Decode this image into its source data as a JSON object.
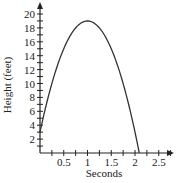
{
  "chart_data": {
    "type": "line",
    "title": "",
    "xlabel": "Seconds",
    "ylabel": "Height (feet)",
    "xlim": [
      0,
      2.75
    ],
    "ylim": [
      0,
      21
    ],
    "x_tick_labels": [
      "0.5",
      "1",
      "1.5",
      "2",
      "2.5"
    ],
    "x_tick_values": [
      0.5,
      1,
      1.5,
      2,
      2.5
    ],
    "x_minor_step": 0.25,
    "y_tick_labels": [
      "2",
      "4",
      "6",
      "8",
      "10",
      "12",
      "14",
      "16",
      "18",
      "20"
    ],
    "y_tick_values": [
      2,
      4,
      6,
      8,
      10,
      12,
      14,
      16,
      18,
      20
    ],
    "y_minor_step": 1,
    "grid": false,
    "legend": null,
    "series": [
      {
        "name": "height",
        "x": [
          0,
          0.25,
          0.5,
          0.75,
          1.0,
          1.25,
          1.5,
          1.75,
          2.0,
          2.09
        ],
        "values": [
          3,
          10,
          15,
          18,
          19,
          18,
          15,
          10,
          3,
          0
        ]
      }
    ],
    "annotation": "Parabolic trajectory: starts at ~3 ft, peaks ~19 ft at 1 s, lands ~2.09 s"
  },
  "colors": {
    "axis": "#222222",
    "curve": "#333333",
    "background": "#ffffff"
  }
}
